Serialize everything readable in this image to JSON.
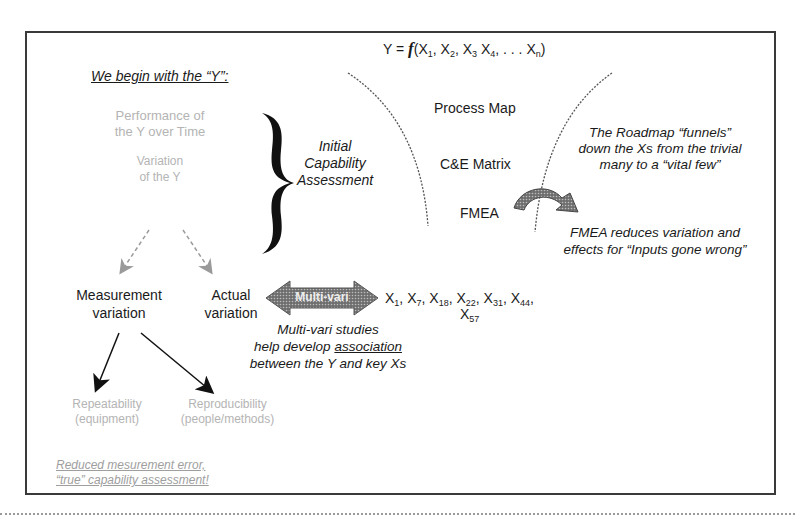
{
  "formula": {
    "prefix": "Y = ",
    "f": "f",
    "open": "(",
    "terms": [
      {
        "base": "X",
        "sub": "1",
        "sep": ", "
      },
      {
        "base": "X",
        "sub": "2",
        "sep": ", "
      },
      {
        "base": "X",
        "sub": "3",
        "sep": " "
      },
      {
        "base": "X",
        "sub": "4",
        "sep": ", . . . "
      },
      {
        "base": "X",
        "sub": "n",
        "sep": ""
      }
    ],
    "close": ")"
  },
  "left": {
    "heading": "We begin with the “Y”:",
    "performance": [
      "Performance of",
      "the Y over Time"
    ],
    "variation": [
      "Variation",
      "of the Y"
    ],
    "brace_label": [
      "Initial",
      "Capability",
      "Assessment"
    ],
    "measurement": [
      "Measurement",
      "variation"
    ],
    "actual": [
      "Actual",
      "variation"
    ],
    "repeatability": [
      "Repeatability",
      "(equipment)"
    ],
    "reproducibility": [
      "Reproducibility",
      "(people/methods)"
    ],
    "conclusion": [
      "Reduced mesurement error,",
      "“true” capability assessment!"
    ]
  },
  "funnel": {
    "items": [
      "Process Map",
      "C&E Matrix",
      "FMEA"
    ],
    "roadmap_note": [
      "The Roadmap “funnels”",
      "down the Xs from the trivial",
      "many to a “vital few”"
    ],
    "fmea_note": [
      "FMEA reduces variation and",
      "effects for “Inputs gone wrong”"
    ]
  },
  "multivari": {
    "arrow_label": "Multi-vari",
    "xs_line1": [
      {
        "base": "X",
        "sub": "1",
        "sep": ", "
      },
      {
        "base": "X",
        "sub": "7",
        "sep": ", "
      },
      {
        "base": "X",
        "sub": "18",
        "sep": ", "
      },
      {
        "base": "X",
        "sub": "22",
        "sep": ", "
      },
      {
        "base": "X",
        "sub": "31",
        "sep": ", "
      },
      {
        "base": "X",
        "sub": "44",
        "sep": ","
      }
    ],
    "xs_line2": {
      "base": "X",
      "sub": "57"
    },
    "note_line1": "Multi-vari studies",
    "note_line2_pre": "help develop ",
    "note_line2_u": "association",
    "note_line3": "between the Y and key Xs"
  },
  "colors": {
    "frame": "#3a3a3a",
    "faded_text": "#b4b4b4",
    "arrow_fill": "#8a8a8a"
  }
}
